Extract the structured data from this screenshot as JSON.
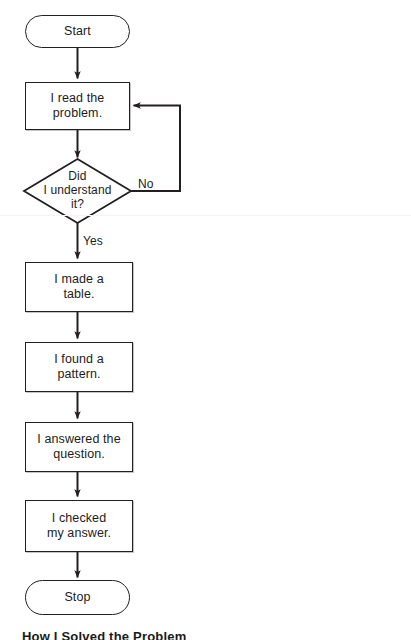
{
  "diagram": {
    "title": "How I Solved the Problem",
    "type": "flowchart",
    "orientation": "top-to-bottom",
    "stroke_color": "#231f20",
    "fill_color": "#ffffff",
    "background_color": "#ffffff",
    "nodes": [
      {
        "id": "start",
        "shape": "terminator",
        "label": "Start"
      },
      {
        "id": "read",
        "shape": "process",
        "label": "I read the\nproblem."
      },
      {
        "id": "understand",
        "shape": "decision",
        "label": "Did\nI understand\nit?"
      },
      {
        "id": "table",
        "shape": "process",
        "label": "I made a\ntable."
      },
      {
        "id": "pattern",
        "shape": "process",
        "label": "I found a\npattern."
      },
      {
        "id": "answer",
        "shape": "process",
        "label": "I answered the\nquestion."
      },
      {
        "id": "check",
        "shape": "process",
        "label": "I checked\nmy answer."
      },
      {
        "id": "stop",
        "shape": "terminator",
        "label": "Stop"
      }
    ],
    "edges": [
      {
        "from": "start",
        "to": "read",
        "label": ""
      },
      {
        "from": "read",
        "to": "understand",
        "label": ""
      },
      {
        "from": "understand",
        "to": "read",
        "label": "No"
      },
      {
        "from": "understand",
        "to": "table",
        "label": "Yes"
      },
      {
        "from": "table",
        "to": "pattern",
        "label": ""
      },
      {
        "from": "pattern",
        "to": "answer",
        "label": ""
      },
      {
        "from": "answer",
        "to": "check",
        "label": ""
      },
      {
        "from": "check",
        "to": "stop",
        "label": ""
      }
    ],
    "branch_labels": {
      "no": "No",
      "yes": "Yes"
    }
  }
}
